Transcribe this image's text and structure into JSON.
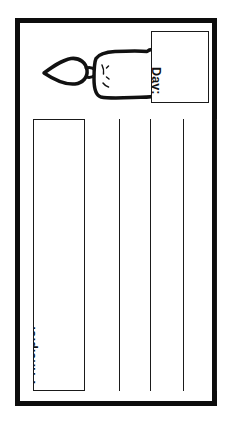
{
  "page": {
    "background_color": "#ffffff",
    "orientation_note": "landscape worksheet rotated 90 degrees clockwise"
  },
  "worksheet": {
    "frame": {
      "border_color": "#0d0d0d",
      "border_width_px": 5,
      "fill_color": "#ffffff"
    },
    "fields": [
      {
        "name": "day-field",
        "label": "Day:",
        "value": "",
        "placeholder": "",
        "rotation_deg": 90,
        "border_color": "#1a1a1a"
      },
      {
        "name": "principle-field",
        "label": "Principle:",
        "value": "",
        "placeholder": "",
        "rotation_deg": 90,
        "border_color": "#1a1a1a"
      }
    ],
    "divider_lines": [
      {
        "name": "divider-1",
        "x_px": 99
      },
      {
        "name": "divider-2",
        "x_px": 130
      },
      {
        "name": "divider-3",
        "x_px": 163
      },
      {
        "name": "divider-4",
        "x_px": 196
      }
    ],
    "divider_color": "#1b1b1b",
    "illustration": {
      "name": "candle-illustration",
      "description": "hand drawn lit candle lying on its side with flame pointing left",
      "ink_color": "#111111",
      "parts": [
        "flame",
        "wick",
        "candle-body"
      ]
    }
  }
}
